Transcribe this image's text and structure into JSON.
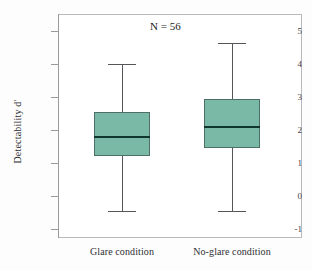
{
  "chart_data": {
    "type": "box",
    "title": "",
    "xlabel": "",
    "ylabel": "Detectability  d'",
    "annotation": "N = 56",
    "ylim": [
      -1,
      5.4
    ],
    "yticks": [
      5,
      4,
      3,
      2,
      1,
      0,
      -1
    ],
    "ytick_labels": [
      "5",
      "4",
      "3",
      "2",
      "1",
      "0",
      "-1"
    ],
    "grid": false,
    "legend": "none",
    "categories": [
      "Glare condition",
      "No-glare condition"
    ],
    "box_color": "#7ab9a6",
    "boxes": [
      {
        "category": "Glare condition",
        "whisker_low": -0.45,
        "q1": 1.22,
        "median": 1.82,
        "q3": 2.55,
        "whisker_high": 4.0
      },
      {
        "category": "No-glare condition",
        "whisker_low": -0.45,
        "q1": 1.45,
        "median": 2.13,
        "q3": 2.95,
        "whisker_high": 4.65
      }
    ]
  }
}
